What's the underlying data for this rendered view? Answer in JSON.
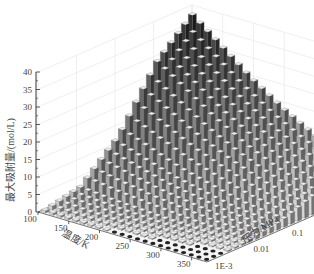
{
  "chart_data": {
    "type": "bar3d",
    "title": "",
    "zlabel": "最大吸附量/(mol/L)",
    "xlabel": "温度/K",
    "ylabel": "压力/MPa",
    "z_ticks": [
      "0",
      "5",
      "10",
      "15",
      "20",
      "25",
      "30",
      "35",
      "40"
    ],
    "zlim": [
      0,
      40
    ],
    "x_ticks": [
      "100",
      "150",
      "200",
      "250",
      "300",
      "350"
    ],
    "xlim": [
      100,
      375
    ],
    "y_ticks": [
      "1E-3",
      "0.01",
      "0.1",
      "1",
      "10"
    ],
    "y_scale": "log",
    "ylim": [
      0.001,
      10
    ],
    "grid": true,
    "bar_color_scale": "grayscale (dark at low T / high P, light elsewhere)",
    "series": [
      {
        "name": "T=100K",
        "pressure": [
          0.001,
          0.01,
          0.1,
          1,
          10
        ],
        "values": [
          0.5,
          3,
          13,
          30,
          40
        ]
      },
      {
        "name": "T=150K",
        "pressure": [
          0.001,
          0.01,
          0.1,
          1,
          10
        ],
        "values": [
          0.3,
          2,
          10,
          24,
          33
        ]
      },
      {
        "name": "T=200K",
        "pressure": [
          0.001,
          0.01,
          0.1,
          1,
          10
        ],
        "values": [
          0.2,
          1.5,
          7,
          18,
          26
        ]
      },
      {
        "name": "T=250K",
        "pressure": [
          0.001,
          0.01,
          0.1,
          1,
          10
        ],
        "values": [
          0.1,
          1,
          5,
          13,
          20
        ]
      },
      {
        "name": "T=300K",
        "pressure": [
          0.001,
          0.01,
          0.1,
          1,
          10
        ],
        "values": [
          0.1,
          0.7,
          3,
          9,
          15
        ]
      },
      {
        "name": "T=350K",
        "pressure": [
          0.001,
          0.01,
          0.1,
          1,
          10
        ],
        "values": [
          0.05,
          0.5,
          2,
          6,
          11
        ]
      }
    ]
  },
  "labels": {
    "zlabel": "最大吸附量/(mol/L)",
    "xlabel": "温度/K",
    "ylabel": "压力/MPa"
  }
}
